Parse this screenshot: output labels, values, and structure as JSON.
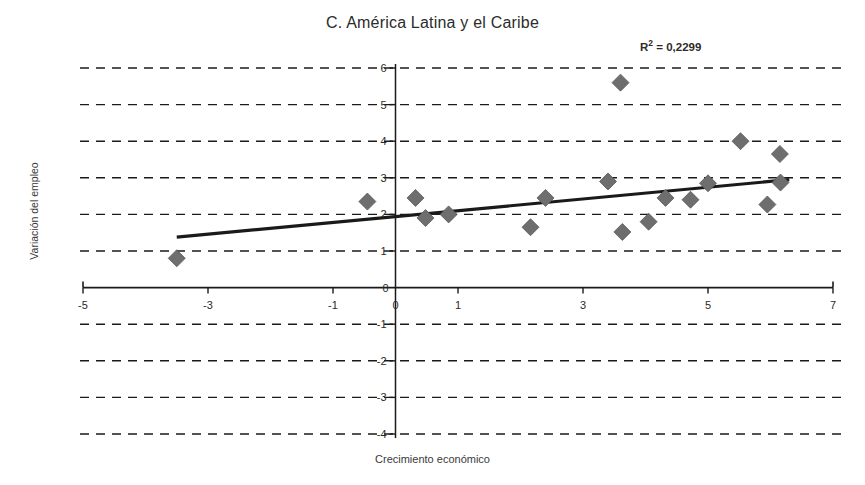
{
  "chart_data": {
    "type": "scatter",
    "title": "C. América Latina y el Caribe",
    "xlabel": "Crecimiento económico",
    "ylabel": "Variación del empleo",
    "annotation": "R² = 0,2299",
    "r_squared": 0.2299,
    "xlim": [
      -5,
      7
    ],
    "ylim": [
      -4,
      6
    ],
    "xticks": [
      -5,
      -3,
      -1,
      0,
      1,
      3,
      5,
      7
    ],
    "xtick_labels": [
      "-5",
      "-3",
      "-1",
      "0",
      "1",
      "3",
      "5",
      "7"
    ],
    "yticks": [
      -4,
      -3,
      -2,
      -1,
      0,
      1,
      2,
      3,
      4,
      5,
      6
    ],
    "ytick_labels": [
      "-4",
      "-3",
      "-2",
      "-1",
      "0",
      "1",
      "2",
      "3",
      "4",
      "5",
      "6"
    ],
    "grid": "horizontal-dashed",
    "legend": null,
    "marker": "diamond",
    "marker_color": "#6e6e6e",
    "line_color": "#1a1a1a",
    "points": [
      {
        "x": -3.5,
        "y": 0.8
      },
      {
        "x": -0.45,
        "y": 2.35
      },
      {
        "x": 0.32,
        "y": 2.45
      },
      {
        "x": 0.48,
        "y": 1.9
      },
      {
        "x": 0.85,
        "y": 2.0
      },
      {
        "x": 2.16,
        "y": 1.65
      },
      {
        "x": 2.4,
        "y": 2.45
      },
      {
        "x": 3.4,
        "y": 2.9
      },
      {
        "x": 3.6,
        "y": 5.6
      },
      {
        "x": 3.63,
        "y": 1.52
      },
      {
        "x": 4.05,
        "y": 1.8
      },
      {
        "x": 4.32,
        "y": 2.45
      },
      {
        "x": 4.72,
        "y": 2.4
      },
      {
        "x": 5.0,
        "y": 2.85
      },
      {
        "x": 5.52,
        "y": 4.0
      },
      {
        "x": 6.15,
        "y": 3.65
      },
      {
        "x": 6.16,
        "y": 2.87
      },
      {
        "x": 5.95,
        "y": 2.27
      }
    ],
    "trendline": {
      "x0": -3.5,
      "y0": 1.38,
      "x1": 6.3,
      "y1": 2.95
    }
  }
}
